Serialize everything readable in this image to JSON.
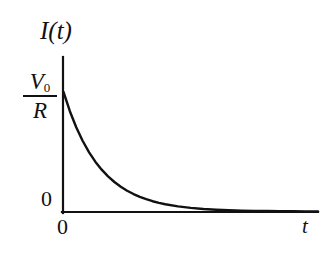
{
  "figure": {
    "background_color": "#ffffff",
    "ink_color": "#111111"
  },
  "axes": {
    "y_axis_label": "I(t)",
    "x_axis_label": "t",
    "y_zero_tick_label": "0",
    "x_origin_label": "0",
    "y_max_label": {
      "numerator": "V",
      "numerator_subscript": "0",
      "denominator": "R"
    }
  },
  "chart_data": {
    "type": "line",
    "title": "",
    "xlabel": "t",
    "ylabel": "I(t)",
    "xlim": [
      0,
      10
    ],
    "ylim": [
      0,
      1
    ],
    "grid": false,
    "legend": null,
    "annotations": [
      {
        "text": "V0/R",
        "axis": "y",
        "value": 1
      },
      {
        "text": "0",
        "axis": "y",
        "value": 0
      },
      {
        "text": "0",
        "axis": "x",
        "value": 0
      },
      {
        "text": "t",
        "axis": "x",
        "value": 10
      }
    ],
    "series": [
      {
        "name": "I(t) = (V0/R) e^(-t/tau)",
        "x": [
          0.0,
          0.25,
          0.5,
          0.75,
          1.0,
          1.25,
          1.5,
          1.75,
          2.0,
          2.25,
          2.5,
          2.75,
          3.0,
          3.25,
          3.5,
          3.75,
          4.0,
          4.5,
          5.0,
          5.5,
          6.0,
          6.5,
          7.0,
          7.5,
          8.0,
          8.5,
          9.0,
          9.5,
          10.0
        ],
        "y": [
          1.0,
          0.839,
          0.705,
          0.592,
          0.497,
          0.417,
          0.35,
          0.294,
          0.247,
          0.207,
          0.174,
          0.146,
          0.122,
          0.103,
          0.086,
          0.072,
          0.061,
          0.043,
          0.03,
          0.021,
          0.015,
          0.011,
          0.007,
          0.005,
          0.004,
          0.003,
          0.002,
          0.001,
          0.001
        ]
      }
    ]
  }
}
